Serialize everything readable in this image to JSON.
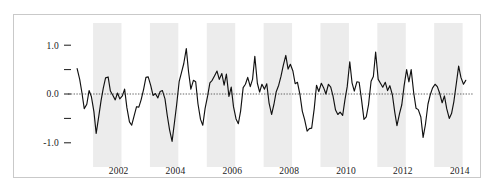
{
  "figure": {
    "border_color": "#c9c9c9",
    "background": "#ffffff"
  },
  "chart_data": {
    "type": "line",
    "title": "",
    "subtitle": "",
    "xlabel": "",
    "ylabel": "",
    "ylim": [
      -1.25,
      1.25
    ],
    "xlim": [
      2001.0,
      2015.0
    ],
    "grid": false,
    "legend": null,
    "zero_line": {
      "value": 0.0,
      "style": "dotted",
      "color": "#555555"
    },
    "shaded_bands": {
      "color": "#ececec",
      "description": "alternating vertical year bands",
      "ranges": [
        [
          2001.6,
          2002.6
        ],
        [
          2003.6,
          2004.6
        ],
        [
          2005.6,
          2006.6
        ],
        [
          2007.6,
          2008.6
        ],
        [
          2009.6,
          2010.6
        ],
        [
          2011.6,
          2012.6
        ],
        [
          2013.6,
          2014.6
        ]
      ]
    },
    "yticks": [
      1.0,
      0.5,
      0.0,
      -0.5,
      -1.0
    ],
    "ytick_labels": [
      "1.0",
      "",
      "0.0",
      "",
      "-1.0"
    ],
    "xticks": [
      2002,
      2004,
      2006,
      2008,
      2010,
      2012,
      2014
    ],
    "xtick_labels": [
      "2002",
      "2004",
      "2006",
      "2008",
      "2010",
      "2012",
      "2014"
    ],
    "series": [
      {
        "name": "series-1",
        "color": "#111111",
        "x": [
          2001.04,
          2001.13,
          2001.21,
          2001.29,
          2001.38,
          2001.46,
          2001.54,
          2001.63,
          2001.71,
          2001.79,
          2001.88,
          2001.96,
          2002.04,
          2002.13,
          2002.21,
          2002.29,
          2002.38,
          2002.46,
          2002.54,
          2002.63,
          2002.71,
          2002.79,
          2002.88,
          2002.96,
          2003.04,
          2003.13,
          2003.21,
          2003.29,
          2003.38,
          2003.46,
          2003.54,
          2003.63,
          2003.71,
          2003.79,
          2003.88,
          2003.96,
          2004.04,
          2004.13,
          2004.21,
          2004.29,
          2004.38,
          2004.46,
          2004.54,
          2004.63,
          2004.71,
          2004.79,
          2004.88,
          2004.96,
          2005.04,
          2005.13,
          2005.21,
          2005.29,
          2005.38,
          2005.46,
          2005.54,
          2005.63,
          2005.71,
          2005.79,
          2005.88,
          2005.96,
          2006.04,
          2006.13,
          2006.21,
          2006.29,
          2006.38,
          2006.46,
          2006.54,
          2006.63,
          2006.71,
          2006.79,
          2006.88,
          2006.96,
          2007.04,
          2007.13,
          2007.21,
          2007.29,
          2007.38,
          2007.46,
          2007.54,
          2007.63,
          2007.71,
          2007.79,
          2007.88,
          2007.96,
          2008.04,
          2008.13,
          2008.21,
          2008.29,
          2008.38,
          2008.46,
          2008.54,
          2008.63,
          2008.71,
          2008.79,
          2008.88,
          2008.96,
          2009.04,
          2009.13,
          2009.21,
          2009.29,
          2009.38,
          2009.46,
          2009.54,
          2009.63,
          2009.71,
          2009.79,
          2009.88,
          2009.96,
          2010.04,
          2010.13,
          2010.21,
          2010.29,
          2010.38,
          2010.46,
          2010.54,
          2010.63,
          2010.71,
          2010.79,
          2010.88,
          2010.96,
          2011.04,
          2011.13,
          2011.21,
          2011.29,
          2011.38,
          2011.46,
          2011.54,
          2011.63,
          2011.71,
          2011.79,
          2011.88,
          2011.96,
          2012.04,
          2012.13,
          2012.21,
          2012.29,
          2012.38,
          2012.46,
          2012.54,
          2012.63,
          2012.71,
          2012.79,
          2012.88,
          2012.96,
          2013.04,
          2013.13,
          2013.21,
          2013.29,
          2013.38,
          2013.46,
          2013.54,
          2013.63,
          2013.71,
          2013.79,
          2013.88,
          2013.96,
          2014.04,
          2014.13,
          2014.21,
          2014.29,
          2014.38,
          2014.46,
          2014.54,
          2014.63,
          2014.71
        ],
        "values": [
          0.52,
          0.3,
          0.02,
          -0.3,
          -0.21,
          0.07,
          -0.05,
          -0.36,
          -0.81,
          -0.5,
          -0.14,
          0.12,
          0.33,
          0.35,
          0.06,
          -0.02,
          -0.12,
          0.02,
          -0.1,
          -0.04,
          0.1,
          -0.28,
          -0.57,
          -0.64,
          -0.46,
          -0.26,
          -0.27,
          -0.12,
          0.1,
          0.34,
          0.35,
          0.17,
          -0.03,
          0.01,
          -0.08,
          0.05,
          0.07,
          -0.1,
          -0.44,
          -0.73,
          -0.97,
          -0.6,
          -0.22,
          0.26,
          0.44,
          0.62,
          0.93,
          0.45,
          0.1,
          0.28,
          0.25,
          -0.2,
          -0.52,
          -0.64,
          -0.3,
          -0.04,
          0.23,
          0.28,
          0.38,
          0.47,
          0.3,
          0.42,
          0.18,
          0.41,
          -0.05,
          0.14,
          -0.26,
          -0.51,
          -0.61,
          -0.35,
          0.13,
          0.2,
          0.34,
          0.15,
          0.3,
          0.77,
          0.22,
          0.04,
          0.2,
          0.1,
          0.21,
          -0.18,
          -0.42,
          -0.22,
          0.04,
          0.18,
          0.36,
          0.58,
          0.79,
          0.51,
          0.61,
          0.47,
          0.21,
          0.24,
          -0.02,
          -0.35,
          -0.52,
          -0.76,
          -0.71,
          -0.7,
          -0.3,
          0.18,
          0.05,
          0.22,
          0.13,
          0.0,
          0.2,
          0.14,
          -0.04,
          -0.33,
          -0.42,
          -0.37,
          -0.44,
          -0.12,
          0.15,
          0.66,
          0.23,
          0.06,
          0.25,
          0.24,
          -0.1,
          -0.52,
          -0.47,
          -0.22,
          0.26,
          0.36,
          0.86,
          0.3,
          0.22,
          0.14,
          0.24,
          0.07,
          0.17,
          -0.02,
          -0.36,
          -0.65,
          -0.4,
          -0.22,
          0.16,
          0.5,
          0.25,
          0.5,
          0.02,
          -0.29,
          -0.32,
          -0.47,
          -0.89,
          -0.63,
          -0.21,
          -0.02,
          0.12,
          0.2,
          0.15,
          0.02,
          -0.18,
          -0.04,
          -0.3,
          -0.5,
          -0.4,
          -0.16,
          0.22,
          0.57,
          0.34,
          0.2,
          0.28
        ]
      }
    ]
  }
}
